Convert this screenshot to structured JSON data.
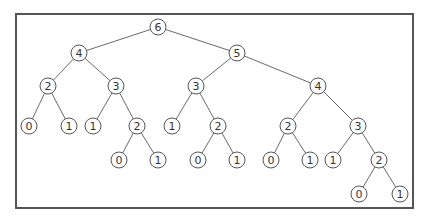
{
  "diagram": {
    "type": "tree",
    "frame": {
      "x": 16,
      "y": 14,
      "width": 397,
      "height": 194
    },
    "node_radius": 8,
    "colors": {
      "stroke": "#555555",
      "edge": "#6a6a6a",
      "text": "#333333",
      "fill": "#ffffff"
    },
    "nodes": [
      {
        "id": "n0",
        "label": "6",
        "x": 158,
        "y": 27
      },
      {
        "id": "n1",
        "label": "4",
        "x": 79,
        "y": 53
      },
      {
        "id": "n2",
        "label": "5",
        "x": 237,
        "y": 53
      },
      {
        "id": "n3",
        "label": "2",
        "x": 48,
        "y": 86
      },
      {
        "id": "n4",
        "label": "3",
        "x": 116,
        "y": 86
      },
      {
        "id": "n5",
        "label": "3",
        "x": 196,
        "y": 86
      },
      {
        "id": "n6",
        "label": "4",
        "x": 318,
        "y": 86
      },
      {
        "id": "n7",
        "label": "0",
        "x": 29,
        "y": 126
      },
      {
        "id": "n8",
        "label": "1",
        "x": 69,
        "y": 126
      },
      {
        "id": "n9",
        "label": "1",
        "x": 93,
        "y": 126
      },
      {
        "id": "n10",
        "label": "2",
        "x": 137,
        "y": 126
      },
      {
        "id": "n11",
        "label": "1",
        "x": 172,
        "y": 126
      },
      {
        "id": "n12",
        "label": "2",
        "x": 218,
        "y": 126
      },
      {
        "id": "n13",
        "label": "2",
        "x": 288,
        "y": 126
      },
      {
        "id": "n14",
        "label": "3",
        "x": 358,
        "y": 126
      },
      {
        "id": "n15",
        "label": "0",
        "x": 119,
        "y": 160
      },
      {
        "id": "n16",
        "label": "1",
        "x": 158,
        "y": 160
      },
      {
        "id": "n17",
        "label": "0",
        "x": 198,
        "y": 160
      },
      {
        "id": "n18",
        "label": "1",
        "x": 237,
        "y": 160
      },
      {
        "id": "n19",
        "label": "0",
        "x": 271,
        "y": 160
      },
      {
        "id": "n20",
        "label": "1",
        "x": 310,
        "y": 160
      },
      {
        "id": "n21",
        "label": "1",
        "x": 333,
        "y": 160
      },
      {
        "id": "n22",
        "label": "2",
        "x": 379,
        "y": 160
      },
      {
        "id": "n23",
        "label": "0",
        "x": 359,
        "y": 194
      },
      {
        "id": "n24",
        "label": "1",
        "x": 400,
        "y": 194
      }
    ],
    "edges": [
      [
        "n0",
        "n1"
      ],
      [
        "n0",
        "n2"
      ],
      [
        "n1",
        "n3"
      ],
      [
        "n1",
        "n4"
      ],
      [
        "n2",
        "n5"
      ],
      [
        "n2",
        "n6"
      ],
      [
        "n3",
        "n7"
      ],
      [
        "n3",
        "n8"
      ],
      [
        "n4",
        "n9"
      ],
      [
        "n4",
        "n10"
      ],
      [
        "n5",
        "n11"
      ],
      [
        "n5",
        "n12"
      ],
      [
        "n6",
        "n13"
      ],
      [
        "n6",
        "n14"
      ],
      [
        "n10",
        "n15"
      ],
      [
        "n10",
        "n16"
      ],
      [
        "n12",
        "n17"
      ],
      [
        "n12",
        "n18"
      ],
      [
        "n13",
        "n19"
      ],
      [
        "n13",
        "n20"
      ],
      [
        "n14",
        "n21"
      ],
      [
        "n14",
        "n22"
      ],
      [
        "n22",
        "n23"
      ],
      [
        "n22",
        "n24"
      ]
    ]
  }
}
